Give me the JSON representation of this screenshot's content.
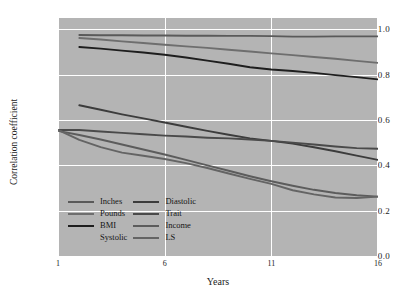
{
  "chart_data": {
    "type": "line",
    "title": "",
    "xlabel": "Years",
    "ylabel": "Correlation coefficient",
    "xlim": [
      1,
      16
    ],
    "ylim": [
      0.0,
      1.05
    ],
    "xticks": [
      1,
      6,
      11,
      16
    ],
    "xtick_labels": [
      "1",
      "6",
      "11",
      "16"
    ],
    "yticks": [
      0.0,
      0.2,
      0.4,
      0.6,
      0.8,
      1.0
    ],
    "ytick_labels": [
      "0.0",
      "0.2",
      "0.4",
      "0.6",
      "0.8",
      "1.0"
    ],
    "grid": true,
    "grid_color": "#ffffff",
    "plot_bgcolor": "#b4b4b4",
    "legend_position": "lower-left-inside",
    "legend_columns": 2,
    "series": [
      {
        "name": "Inches",
        "color": "#5a5a5a",
        "x": [
          2,
          3,
          4,
          5,
          6,
          7,
          8,
          9,
          10,
          11,
          12,
          13,
          14,
          15,
          16
        ],
        "values": [
          0.975,
          0.974,
          0.974,
          0.973,
          0.973,
          0.972,
          0.972,
          0.971,
          0.971,
          0.97,
          0.968,
          0.968,
          0.969,
          0.969,
          0.969
        ]
      },
      {
        "name": "Pounds",
        "color": "#6e6e6e",
        "x": [
          2,
          3,
          4,
          5,
          6,
          7,
          8,
          9,
          10,
          11,
          12,
          13,
          14,
          15,
          16
        ],
        "values": [
          0.962,
          0.955,
          0.947,
          0.94,
          0.932,
          0.925,
          0.918,
          0.91,
          0.902,
          0.894,
          0.886,
          0.878,
          0.87,
          0.861,
          0.852
        ]
      },
      {
        "name": "BMI",
        "color": "#1e1e1e",
        "x": [
          2,
          3,
          4,
          5,
          6,
          7,
          8,
          9,
          10,
          11,
          12,
          13,
          14,
          15,
          16
        ],
        "values": [
          0.922,
          0.915,
          0.906,
          0.898,
          0.888,
          0.876,
          0.862,
          0.848,
          0.833,
          0.823,
          0.816,
          0.808,
          0.798,
          0.789,
          0.779
        ]
      },
      {
        "name": "Systolic",
        "color": "#b4b4b4",
        "x": [],
        "values": []
      },
      {
        "name": "Diastolic",
        "color": "#3c3c3c",
        "x": [
          2,
          3,
          4,
          5,
          6,
          7,
          8,
          9,
          10,
          11,
          12,
          13,
          14,
          15,
          16
        ],
        "values": [
          0.665,
          0.645,
          0.625,
          0.607,
          0.589,
          0.57,
          0.552,
          0.535,
          0.519,
          0.508,
          0.496,
          0.48,
          0.462,
          0.443,
          0.424
        ]
      },
      {
        "name": "Trait",
        "color": "#4a4a4a",
        "x": [
          1,
          2,
          3,
          4,
          5,
          6,
          7,
          8,
          9,
          10,
          11,
          12,
          13,
          14,
          15,
          16
        ],
        "values": [
          0.556,
          0.556,
          0.549,
          0.543,
          0.537,
          0.531,
          0.527,
          0.522,
          0.519,
          0.514,
          0.508,
          0.5,
          0.492,
          0.483,
          0.476,
          0.473
        ]
      },
      {
        "name": "Income",
        "color": "#5c5c5c",
        "x": [
          1,
          2,
          3,
          4,
          5,
          6,
          7,
          8,
          9,
          10,
          11,
          12,
          13,
          14,
          15,
          16
        ],
        "values": [
          0.552,
          0.534,
          0.514,
          0.492,
          0.47,
          0.448,
          0.424,
          0.4,
          0.376,
          0.352,
          0.33,
          0.31,
          0.292,
          0.278,
          0.268,
          0.262
        ]
      },
      {
        "name": "LS",
        "color": "#646464",
        "x": [
          1,
          2,
          3,
          4,
          5,
          6,
          7,
          8,
          9,
          10,
          11,
          12,
          13,
          14,
          15,
          16
        ],
        "values": [
          0.556,
          0.512,
          0.48,
          0.456,
          0.442,
          0.428,
          0.41,
          0.388,
          0.364,
          0.34,
          0.318,
          0.29,
          0.272,
          0.258,
          0.256,
          0.262
        ]
      }
    ]
  },
  "legend": {
    "entries": [
      {
        "label": "Inches",
        "color": "#5a5a5a"
      },
      {
        "label": "Diastolic",
        "color": "#3c3c3c"
      },
      {
        "label": "Pounds",
        "color": "#6e6e6e"
      },
      {
        "label": "Trait",
        "color": "#4a4a4a"
      },
      {
        "label": "BMI",
        "color": "#1e1e1e"
      },
      {
        "label": "Income",
        "color": "#5c5c5c"
      },
      {
        "label": "Systolic",
        "color": "#b4b4b4"
      },
      {
        "label": "LS",
        "color": "#646464"
      }
    ]
  }
}
